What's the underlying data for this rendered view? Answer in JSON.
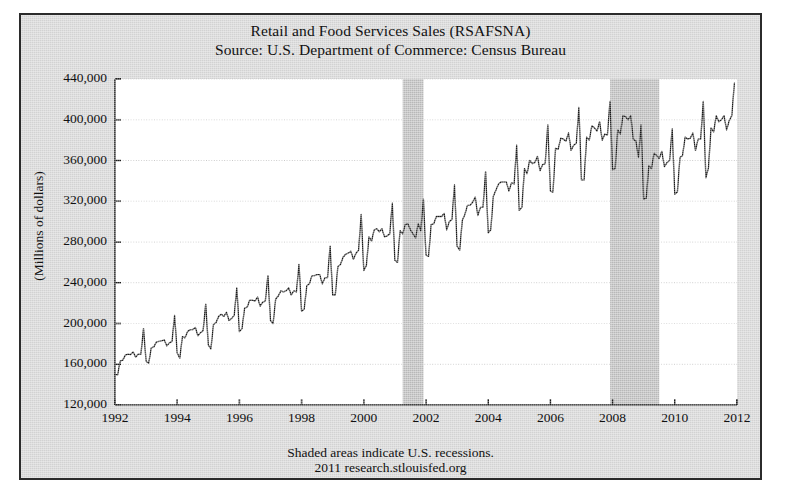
{
  "chart_data": {
    "type": "line",
    "title": "Retail and Food Services Sales (RSAFSNA)",
    "subtitle": "Source: U.S. Department of Commerce: Census Bureau",
    "ylabel": "(Millions of dollars)",
    "xlabel": "",
    "ylim": [
      120000,
      440000
    ],
    "xlim": [
      1992,
      2012
    ],
    "yticks": [
      "120,000",
      "160,000",
      "200,000",
      "240,000",
      "280,000",
      "320,000",
      "360,000",
      "400,000",
      "440,000"
    ],
    "ytick_values": [
      120000,
      160000,
      200000,
      240000,
      280000,
      320000,
      360000,
      400000,
      440000
    ],
    "xticks": [
      "1992",
      "1994",
      "1996",
      "1998",
      "2000",
      "2002",
      "2004",
      "2006",
      "2008",
      "2010",
      "2012"
    ],
    "xtick_values": [
      1992,
      1994,
      1996,
      1998,
      2000,
      2002,
      2004,
      2006,
      2008,
      2010,
      2012
    ],
    "grid": true,
    "legend": "none",
    "line_color": "#1a1a1a",
    "plot_bg": "#ffffff",
    "figure_bg": "#d2d2d2",
    "shaded_color": "#b8b8b8",
    "footnote_line1": "Shaded areas indicate U.S. recessions.",
    "footnote_line2": "2011 research.stlouisfed.org",
    "recessions": [
      {
        "label": "2001 recession",
        "start": 2001.25,
        "end": 2001.92
      },
      {
        "label": "2007-2009 recession",
        "start": 2007.92,
        "end": 2009.5
      }
    ],
    "series": [
      {
        "name": "Retail and Food Services Sales (NSA)",
        "x_start": 1992.0,
        "x_step": 0.08333,
        "units": "Millions of dollars",
        "frequency": "Monthly",
        "values": [
          150000,
          149500,
          163000,
          164000,
          169000,
          170000,
          169500,
          172000,
          167000,
          170000,
          170000,
          195000,
          163000,
          161000,
          176000,
          177000,
          182000,
          182500,
          183000,
          184000,
          178000,
          181000,
          182500,
          208000,
          171000,
          166000,
          187000,
          186000,
          192000,
          194000,
          194000,
          196000,
          188000,
          191000,
          193000,
          219000,
          179000,
          175000,
          199000,
          201000,
          207000,
          209000,
          207000,
          211000,
          203000,
          205000,
          208000,
          235000,
          192000,
          195000,
          215000,
          216000,
          223000,
          223000,
          222000,
          226000,
          217000,
          221000,
          222000,
          247000,
          203000,
          200000,
          224000,
          227000,
          232000,
          231000,
          232000,
          235000,
          228000,
          232000,
          231000,
          258000,
          212000,
          214000,
          237000,
          239000,
          247000,
          247000,
          248000,
          248000,
          239000,
          245000,
          245000,
          276000,
          228000,
          228000,
          256000,
          258000,
          265000,
          268000,
          269000,
          271000,
          263000,
          269000,
          272000,
          307000,
          252000,
          257000,
          285000,
          281000,
          292000,
          293000,
          290000,
          293000,
          285000,
          286000,
          288000,
          318000,
          262000,
          260000,
          291000,
          288000,
          297000,
          298000,
          292000,
          288000,
          284000,
          298000,
          291000,
          322000,
          267000,
          266000,
          297000,
          298000,
          305000,
          305000,
          305000,
          308000,
          292000,
          300000,
          302000,
          336000,
          276000,
          272000,
          301000,
          307000,
          316000,
          316000,
          319000,
          324000,
          306000,
          314000,
          314000,
          349000,
          289000,
          292000,
          325000,
          331000,
          337000,
          339000,
          339000,
          339000,
          330000,
          338000,
          337000,
          375000,
          311000,
          314000,
          352000,
          347000,
          360000,
          357000,
          358000,
          364000,
          350000,
          356000,
          357000,
          395000,
          330000,
          329000,
          372000,
          371000,
          382000,
          381000,
          379000,
          387000,
          370000,
          375000,
          377000,
          412000,
          341000,
          341000,
          383000,
          380000,
          394000,
          392000,
          389000,
          398000,
          380000,
          386000,
          385000,
          418000,
          351000,
          352000,
          390000,
          386000,
          404000,
          403000,
          400000,
          404000,
          381000,
          379000,
          363000,
          395000,
          322000,
          323000,
          355000,
          352000,
          367000,
          365000,
          362000,
          369000,
          354000,
          358000,
          360000,
          391000,
          327000,
          329000,
          363000,
          365000,
          383000,
          381000,
          382000,
          387000,
          370000,
          381000,
          381000,
          418000,
          343000,
          353000,
          392000,
          388000,
          404000,
          398000,
          400000,
          404000,
          390000,
          399000,
          404000,
          436000
        ]
      }
    ]
  }
}
